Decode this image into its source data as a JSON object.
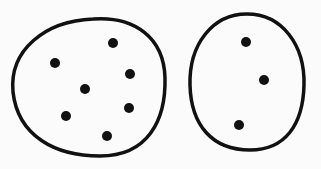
{
  "diagram": {
    "stroke_color": "#111111",
    "background": "#fbfbfb",
    "groups": [
      {
        "name": "left-group",
        "dot_count": 7,
        "dots": [
          [
            113,
            43
          ],
          [
            55,
            63
          ],
          [
            130,
            74
          ],
          [
            85,
            89
          ],
          [
            129,
            108
          ],
          [
            66,
            116
          ],
          [
            107,
            136
          ]
        ]
      },
      {
        "name": "right-group",
        "dot_count": 3,
        "dots": [
          [
            246,
            42
          ],
          [
            264,
            80
          ],
          [
            239,
            125
          ]
        ]
      }
    ]
  }
}
